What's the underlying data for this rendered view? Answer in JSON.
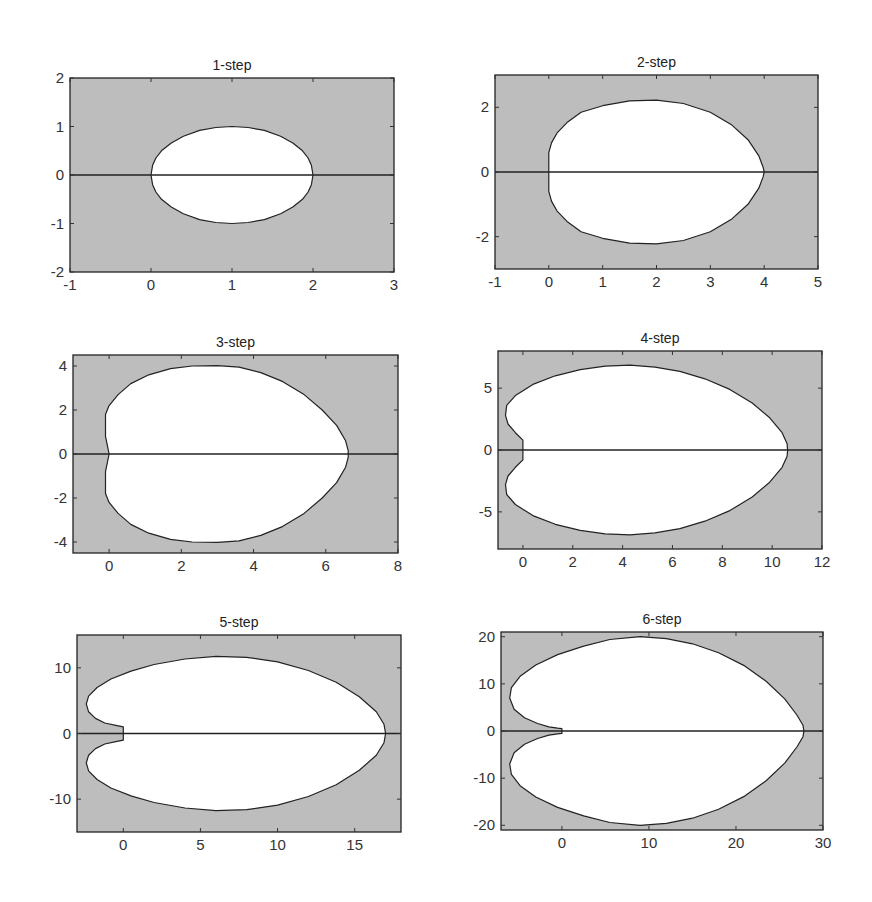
{
  "figure": {
    "colors": {
      "shaded": "#bdbdbd",
      "region": "#ffffff",
      "line": "#222222"
    }
  },
  "chart_data": [
    {
      "type": "area",
      "title": "1-step",
      "xlim": [
        -1,
        3
      ],
      "ylim": [
        -2,
        2
      ],
      "xticks": [
        -1,
        0,
        1,
        2,
        3
      ],
      "yticks": [
        -2,
        -1,
        0,
        1,
        2
      ],
      "box": [
        70,
        78,
        324,
        194
      ],
      "boundary_upper": [
        [
          0,
          0
        ],
        [
          0.02,
          0.2
        ],
        [
          0.06,
          0.35
        ],
        [
          0.13,
          0.5
        ],
        [
          0.25,
          0.66
        ],
        [
          0.4,
          0.8
        ],
        [
          0.6,
          0.92
        ],
        [
          0.8,
          0.98
        ],
        [
          1,
          1
        ],
        [
          1.2,
          0.98
        ],
        [
          1.4,
          0.92
        ],
        [
          1.6,
          0.8
        ],
        [
          1.75,
          0.66
        ],
        [
          1.87,
          0.5
        ],
        [
          1.94,
          0.35
        ],
        [
          1.98,
          0.2
        ],
        [
          2,
          0
        ]
      ],
      "symmetric": true
    },
    {
      "type": "area",
      "title": "2-step",
      "xlim": [
        -1,
        5
      ],
      "ylim": [
        -3,
        3
      ],
      "xticks": [
        -1,
        0,
        1,
        2,
        3,
        4,
        5
      ],
      "yticks": [
        -2,
        0,
        2
      ],
      "box": [
        495,
        75,
        323,
        194
      ],
      "boundary_upper": [
        [
          0,
          0
        ],
        [
          0,
          0.6
        ],
        [
          0.05,
          0.9
        ],
        [
          0.15,
          1.2
        ],
        [
          0.35,
          1.55
        ],
        [
          0.6,
          1.85
        ],
        [
          1,
          2.05
        ],
        [
          1.5,
          2.2
        ],
        [
          2,
          2.22
        ],
        [
          2.5,
          2.12
        ],
        [
          3,
          1.85
        ],
        [
          3.4,
          1.45
        ],
        [
          3.7,
          1.0
        ],
        [
          3.9,
          0.5
        ],
        [
          3.98,
          0.15
        ],
        [
          4,
          0
        ]
      ],
      "symmetric": true
    },
    {
      "type": "area",
      "title": "3-step",
      "xlim": [
        -1,
        8
      ],
      "ylim": [
        -4.5,
        4.5
      ],
      "xticks": [
        0,
        2,
        4,
        6,
        8
      ],
      "yticks": [
        -4,
        -2,
        0,
        2,
        4
      ],
      "box": [
        73,
        355,
        325,
        198
      ],
      "boundary_upper": [
        [
          0,
          0
        ],
        [
          -0.05,
          0.4
        ],
        [
          -0.1,
          0.8
        ],
        [
          -0.1,
          1.4
        ],
        [
          -0.1,
          1.8
        ],
        [
          0,
          2.2
        ],
        [
          0.25,
          2.7
        ],
        [
          0.6,
          3.2
        ],
        [
          1.1,
          3.6
        ],
        [
          1.7,
          3.88
        ],
        [
          2.3,
          4.0
        ],
        [
          3,
          4.02
        ],
        [
          3.6,
          3.95
        ],
        [
          4.2,
          3.7
        ],
        [
          4.8,
          3.3
        ],
        [
          5.4,
          2.7
        ],
        [
          5.9,
          2.0
        ],
        [
          6.3,
          1.3
        ],
        [
          6.55,
          0.6
        ],
        [
          6.62,
          0.15
        ],
        [
          6.62,
          0
        ]
      ],
      "symmetric": true
    },
    {
      "type": "area",
      "title": "4-step",
      "xlim": [
        -1,
        12
      ],
      "ylim": [
        -8,
        8
      ],
      "xticks": [
        0,
        2,
        4,
        6,
        8,
        10,
        12
      ],
      "yticks": [
        -5,
        0,
        5
      ],
      "box": [
        498,
        351,
        324,
        198
      ],
      "boundary_upper": [
        [
          0,
          0
        ],
        [
          0,
          0.8
        ],
        [
          -0.3,
          1.4
        ],
        [
          -0.6,
          2.1
        ],
        [
          -0.7,
          2.8
        ],
        [
          -0.65,
          3.6
        ],
        [
          -0.3,
          4.4
        ],
        [
          0.4,
          5.3
        ],
        [
          1.3,
          6.0
        ],
        [
          2.3,
          6.5
        ],
        [
          3.3,
          6.78
        ],
        [
          4.3,
          6.85
        ],
        [
          5.3,
          6.7
        ],
        [
          6.3,
          6.35
        ],
        [
          7.3,
          5.75
        ],
        [
          8.3,
          4.9
        ],
        [
          9.2,
          3.8
        ],
        [
          9.9,
          2.6
        ],
        [
          10.4,
          1.4
        ],
        [
          10.6,
          0.5
        ],
        [
          10.62,
          0
        ]
      ],
      "symmetric": true
    },
    {
      "type": "area",
      "title": "5-step",
      "xlim": [
        -3,
        18
      ],
      "ylim": [
        -15,
        15
      ],
      "xticks": [
        0,
        5,
        10,
        15
      ],
      "yticks": [
        -10,
        0,
        10
      ],
      "box": [
        77,
        635,
        324,
        197
      ],
      "boundary_upper": [
        [
          0,
          0
        ],
        [
          0,
          1.0
        ],
        [
          -0.4,
          1.2
        ],
        [
          -1.2,
          1.6
        ],
        [
          -1.8,
          2.3
        ],
        [
          -2.25,
          3.3
        ],
        [
          -2.4,
          4.5
        ],
        [
          -2.25,
          5.7
        ],
        [
          -1.7,
          7.0
        ],
        [
          -0.8,
          8.3
        ],
        [
          0.5,
          9.5
        ],
        [
          2,
          10.5
        ],
        [
          4,
          11.35
        ],
        [
          6,
          11.75
        ],
        [
          8,
          11.6
        ],
        [
          10,
          10.9
        ],
        [
          12,
          9.6
        ],
        [
          13.8,
          7.8
        ],
        [
          15.3,
          5.6
        ],
        [
          16.4,
          3.3
        ],
        [
          16.9,
          1.4
        ],
        [
          17.0,
          0
        ]
      ],
      "symmetric": true
    },
    {
      "type": "area",
      "title": "6-step",
      "xlim": [
        -7,
        30
      ],
      "ylim": [
        -21,
        21
      ],
      "xticks": [
        0,
        10,
        20,
        30
      ],
      "yticks": [
        -20,
        -10,
        0,
        10,
        20
      ],
      "box": [
        501,
        632,
        322,
        198
      ],
      "boundary_upper": [
        [
          0,
          0
        ],
        [
          0,
          0.5
        ],
        [
          -0.5,
          0.6
        ],
        [
          -1.5,
          0.9
        ],
        [
          -2.8,
          1.6
        ],
        [
          -4.3,
          2.8
        ],
        [
          -5.5,
          4.6
        ],
        [
          -6,
          7
        ],
        [
          -5.8,
          9.2
        ],
        [
          -4.8,
          11.6
        ],
        [
          -3,
          14
        ],
        [
          -0.5,
          16.2
        ],
        [
          2.5,
          18
        ],
        [
          5.5,
          19.4
        ],
        [
          9,
          20
        ],
        [
          12,
          19.6
        ],
        [
          15,
          18.5
        ],
        [
          18,
          16.6
        ],
        [
          21,
          13.8
        ],
        [
          23.5,
          10.5
        ],
        [
          25.6,
          6.8
        ],
        [
          27,
          3.4
        ],
        [
          27.7,
          1.2
        ],
        [
          27.8,
          0
        ]
      ],
      "symmetric": true
    }
  ]
}
